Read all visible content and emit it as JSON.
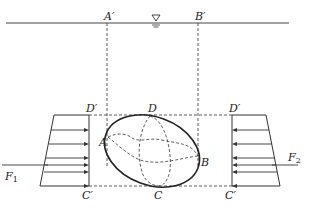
{
  "diagram": {
    "water_level_symbol": "▽",
    "labels": {
      "A_prime": "A′",
      "B_prime": "B′",
      "D": "D",
      "D_prime_left": "D′",
      "D_prime_right": "D′",
      "A": "A",
      "B": "B",
      "C": "C",
      "C_prime_left": "C′",
      "C_prime_right": "C′",
      "F1_main": "F",
      "F1_sub": "1",
      "F2_main": "F",
      "F2_sub": "2"
    },
    "colors": {
      "line": "#333333",
      "background": "#ffffff"
    }
  }
}
